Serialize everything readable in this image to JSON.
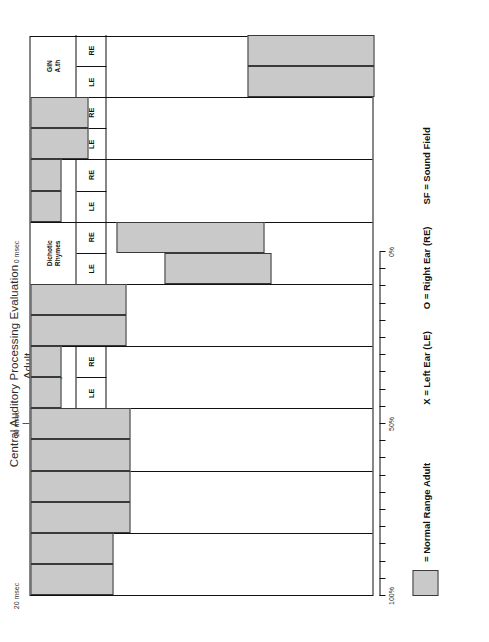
{
  "title": {
    "line1": "Central Auditory Processing Evaluation",
    "line2": "Adult"
  },
  "legend": {
    "swatch_label": "= Normal Range Adult",
    "swatch_color": "#c9c9c9",
    "keys": [
      "X = Left Ear (LE)",
      "O = Right Ear (RE)",
      "SF = Sound Field"
    ]
  },
  "axes": {
    "percent": {
      "labels": [
        "100%",
        "50%",
        "0%"
      ],
      "label_positions": [
        100,
        50,
        0
      ],
      "ticks": [
        100,
        95,
        90,
        85,
        80,
        75,
        70,
        65,
        60,
        55,
        50,
        45,
        40,
        35,
        30,
        25,
        20,
        15,
        10,
        5,
        0
      ]
    },
    "msec": {
      "labels": [
        "20 msec",
        "10 msec",
        "0 msec"
      ],
      "label_positions": [
        20,
        10,
        0
      ],
      "ticks": [
        10
      ]
    }
  },
  "ear_labels": {
    "left": "LE",
    "right": "RE"
  },
  "chart_data": {
    "type": "bar",
    "orientation": "horizontal-normal-range-bands",
    "xlabel": "",
    "ylabel": "Percent Correct",
    "xlim": [
      100,
      0
    ],
    "grid": false,
    "legend_position": "bottom-left",
    "categories": [
      "Frequency Patterns",
      "Duration Patterns",
      "Filtered Words",
      "Dichotic Digits",
      "Speech In Babble",
      "Dichotic Rhymes",
      "Competing Sentences",
      "Compressed Speech",
      "GIN A.th"
    ],
    "series": [
      {
        "name": "LE",
        "bands": [
          {
            "category": "Frequency Patterns",
            "scale": "percent",
            "from": 100,
            "to": 76
          },
          {
            "category": "Duration Patterns",
            "scale": "percent",
            "from": 100,
            "to": 71
          },
          {
            "category": "Filtered Words",
            "scale": "percent",
            "from": 100,
            "to": 71
          },
          {
            "category": "Dichotic Digits",
            "scale": "percent",
            "from": 100,
            "to": 91
          },
          {
            "category": "Speech In Babble",
            "scale": "percent",
            "from": 100,
            "to": 72
          },
          {
            "category": "Dichotic Rhymes",
            "scale": "percent",
            "from": 61,
            "to": 30
          },
          {
            "category": "Competing Sentences",
            "scale": "percent",
            "from": 100,
            "to": 91
          },
          {
            "category": "Compressed Speech",
            "scale": "percent",
            "from": 100,
            "to": 83
          },
          {
            "category": "GIN A.th",
            "scale": "msec",
            "from": 7.6,
            "to": 0
          }
        ]
      },
      {
        "name": "RE",
        "bands": [
          {
            "category": "Frequency Patterns",
            "scale": "percent",
            "from": 100,
            "to": 76
          },
          {
            "category": "Duration Patterns",
            "scale": "percent",
            "from": 100,
            "to": 71
          },
          {
            "category": "Filtered Words",
            "scale": "percent",
            "from": 100,
            "to": 71
          },
          {
            "category": "Dichotic Digits",
            "scale": "percent",
            "from": 100,
            "to": 91
          },
          {
            "category": "Speech In Babble",
            "scale": "percent",
            "from": 100,
            "to": 72
          },
          {
            "category": "Dichotic Rhymes",
            "scale": "percent",
            "from": 75,
            "to": 32
          },
          {
            "category": "Competing Sentences",
            "scale": "percent",
            "from": 100,
            "to": 91
          },
          {
            "category": "Compressed Speech",
            "scale": "percent",
            "from": 100,
            "to": 83
          },
          {
            "category": "GIN A.th",
            "scale": "msec",
            "from": 7.6,
            "to": 0
          }
        ]
      }
    ]
  },
  "columns": [
    {
      "id": "frequency-patterns",
      "label_lines": [
        "Frequency",
        "Patterns"
      ],
      "le": {
        "start_pct": 100,
        "end_pct": 76
      },
      "re": {
        "start_pct": 100,
        "end_pct": 76
      }
    },
    {
      "id": "duration-patterns",
      "label_lines": [
        "Duration",
        "Patterns"
      ],
      "le": {
        "start_pct": 100,
        "end_pct": 71
      },
      "re": {
        "start_pct": 100,
        "end_pct": 71
      }
    },
    {
      "id": "filtered-words",
      "label_lines": [
        "Filtered",
        "Words"
      ],
      "le": {
        "start_pct": 100,
        "end_pct": 71
      },
      "re": {
        "start_pct": 100,
        "end_pct": 71
      }
    },
    {
      "id": "dichotic-digits",
      "label_lines": [
        "Dichotic",
        "Digits"
      ],
      "le": {
        "start_pct": 100,
        "end_pct": 91
      },
      "re": {
        "start_pct": 100,
        "end_pct": 91
      }
    },
    {
      "id": "speech-in-babble",
      "label_lines": [
        "Speech",
        "In",
        "Babble"
      ],
      "le": {
        "start_pct": 100,
        "end_pct": 72
      },
      "re": {
        "start_pct": 100,
        "end_pct": 72
      }
    },
    {
      "id": "dichotic-rhymes",
      "label_lines": [
        "Dichotic",
        "Rhymes"
      ],
      "le": {
        "start_pct": 61,
        "end_pct": 30
      },
      "re": {
        "start_pct": 75,
        "end_pct": 32
      }
    },
    {
      "id": "competing-sentences",
      "label_lines": [
        "Competing",
        "Sentences"
      ],
      "le": {
        "start_pct": 100,
        "end_pct": 91
      },
      "re": {
        "start_pct": 100,
        "end_pct": 91
      }
    },
    {
      "id": "compressed-speech",
      "label_lines": [
        "Compressed",
        "Speech"
      ],
      "le": {
        "start_pct": 100,
        "end_pct": 83
      },
      "re": {
        "start_pct": 100,
        "end_pct": 83
      }
    },
    {
      "id": "gin-ath",
      "label_lines": [
        "GIN",
        "A.th"
      ],
      "le": {
        "start_pct": 37,
        "end_pct": 0
      },
      "re": {
        "start_pct": 37,
        "end_pct": 0
      }
    }
  ]
}
